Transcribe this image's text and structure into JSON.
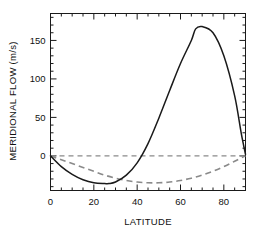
{
  "chart_data": {
    "type": "line",
    "title": "",
    "xlabel": "LATITUDE",
    "ylabel": "MERIDIONAL FLOW (m/s)",
    "xlim": [
      0,
      90
    ],
    "ylim": [
      -45,
      185
    ],
    "xticks": [
      0,
      20,
      40,
      60,
      80
    ],
    "xtick_labels": [
      "0",
      "20",
      "40",
      "60",
      "80"
    ],
    "xminor_step": 5,
    "yticks": [
      0,
      50,
      100,
      150
    ],
    "ytick_labels": [
      "0",
      "50",
      "100",
      "150"
    ],
    "yminor_step": 10,
    "grid": false,
    "legend": "none",
    "frame": "box",
    "annotations": {
      "zero_reference": "dashed horizontal line at y = 0"
    },
    "series": [
      {
        "name": "solid-curve",
        "style": "solid",
        "color": "#1a1a1a",
        "x": [
          0,
          5,
          10,
          15,
          20,
          25,
          27,
          30,
          35,
          40,
          45,
          50,
          55,
          60,
          65,
          67,
          70,
          75,
          80,
          85,
          88,
          90
        ],
        "values": [
          0,
          -14,
          -24,
          -31,
          -35,
          -36,
          -36,
          -34,
          -25,
          -9,
          16,
          49,
          85,
          120,
          150,
          165,
          168,
          160,
          130,
          78,
          30,
          2
        ]
      },
      {
        "name": "dashed-curve",
        "style": "dashed",
        "color": "#8a8a8a",
        "x": [
          0,
          5,
          10,
          15,
          20,
          25,
          30,
          35,
          40,
          45,
          50,
          55,
          60,
          65,
          70,
          75,
          80,
          85,
          90
        ],
        "values": [
          0,
          -5,
          -10,
          -15,
          -20,
          -25,
          -29,
          -32,
          -34,
          -35,
          -35,
          -34,
          -32,
          -29,
          -25,
          -20,
          -14,
          -7,
          0
        ]
      },
      {
        "name": "zero-line",
        "style": "dashed",
        "color": "#8a8a8a",
        "x": [
          0,
          90
        ],
        "values": [
          0,
          0
        ]
      }
    ]
  },
  "figure": {
    "background": "#ffffff",
    "axis_color": "#1a1a1a",
    "dashed_color": "#8a8a8a"
  }
}
